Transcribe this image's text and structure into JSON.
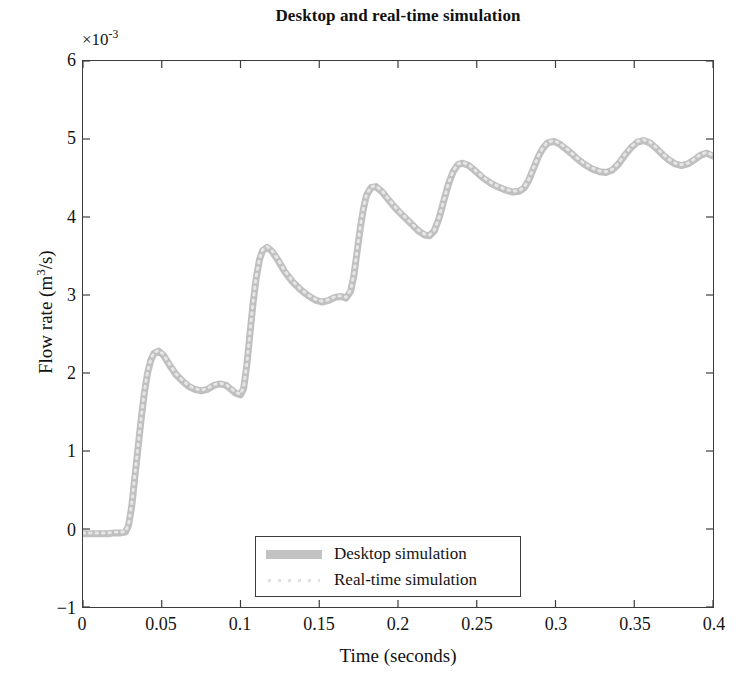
{
  "chart_data": {
    "type": "line",
    "title": "Desktop and real-time simulation",
    "xlabel": "Time (seconds)",
    "ylabel": "Flow rate (m³/s)",
    "y_multiplier": "×10⁻³",
    "y_multiplier_base": "×10",
    "y_multiplier_exp": "-3",
    "xlim": [
      0,
      0.4
    ],
    "ylim": [
      -1,
      6
    ],
    "grid": false,
    "legend_position": "lower center",
    "xticks": [
      0,
      0.05,
      0.1,
      0.15,
      0.2,
      0.25,
      0.3,
      0.35,
      0.4
    ],
    "xtick_labels": [
      "0",
      "0.05",
      "0.1",
      "0.15",
      "0.2",
      "0.25",
      "0.3",
      "0.35",
      "0.4"
    ],
    "yticks": [
      -1,
      0,
      1,
      2,
      3,
      4,
      5,
      6
    ],
    "ytick_labels": [
      "−1",
      "0",
      "1",
      "2",
      "3",
      "4",
      "5",
      "6"
    ],
    "series": [
      {
        "name": "Desktop simulation",
        "color": "#c0c0c0",
        "style": "solid",
        "width": 7,
        "x": [
          0,
          0.004,
          0.008,
          0.012,
          0.016,
          0.02,
          0.024,
          0.027,
          0.029,
          0.031,
          0.033,
          0.035,
          0.037,
          0.039,
          0.041,
          0.043,
          0.045,
          0.048,
          0.051,
          0.055,
          0.059,
          0.063,
          0.067,
          0.071,
          0.075,
          0.079,
          0.083,
          0.087,
          0.091,
          0.094,
          0.097,
          0.1,
          0.102,
          0.104,
          0.106,
          0.108,
          0.11,
          0.112,
          0.114,
          0.117,
          0.12,
          0.124,
          0.128,
          0.133,
          0.138,
          0.143,
          0.148,
          0.152,
          0.156,
          0.16,
          0.164,
          0.167,
          0.17,
          0.172,
          0.174,
          0.176,
          0.178,
          0.18,
          0.183,
          0.186,
          0.19,
          0.194,
          0.199,
          0.204,
          0.209,
          0.213,
          0.217,
          0.22,
          0.223,
          0.226,
          0.229,
          0.232,
          0.235,
          0.238,
          0.241,
          0.245,
          0.249,
          0.254,
          0.259,
          0.264,
          0.269,
          0.273,
          0.277,
          0.28,
          0.283,
          0.286,
          0.289,
          0.292,
          0.295,
          0.299,
          0.303,
          0.308,
          0.313,
          0.318,
          0.323,
          0.328,
          0.332,
          0.336,
          0.34,
          0.344,
          0.348,
          0.352,
          0.356,
          0.36,
          0.364,
          0.368,
          0.372,
          0.376,
          0.38,
          0.384,
          0.388,
          0.392,
          0.396,
          0.4
        ],
        "y": [
          -0.06,
          -0.06,
          -0.06,
          -0.06,
          -0.06,
          -0.05,
          -0.05,
          -0.04,
          0.05,
          0.3,
          0.68,
          1.05,
          1.42,
          1.75,
          2.0,
          2.16,
          2.25,
          2.28,
          2.23,
          2.1,
          1.98,
          1.9,
          1.83,
          1.79,
          1.77,
          1.79,
          1.84,
          1.86,
          1.84,
          1.79,
          1.74,
          1.72,
          1.8,
          2.1,
          2.5,
          2.9,
          3.22,
          3.45,
          3.57,
          3.61,
          3.56,
          3.44,
          3.3,
          3.17,
          3.07,
          2.99,
          2.93,
          2.91,
          2.93,
          2.97,
          2.98,
          2.96,
          3.05,
          3.25,
          3.55,
          3.85,
          4.1,
          4.28,
          4.38,
          4.39,
          4.32,
          4.22,
          4.1,
          4.0,
          3.9,
          3.82,
          3.77,
          3.76,
          3.82,
          3.98,
          4.2,
          4.42,
          4.58,
          4.67,
          4.69,
          4.66,
          4.59,
          4.5,
          4.43,
          4.38,
          4.34,
          4.32,
          4.33,
          4.37,
          4.47,
          4.62,
          4.77,
          4.88,
          4.95,
          4.97,
          4.93,
          4.85,
          4.76,
          4.68,
          4.62,
          4.58,
          4.57,
          4.6,
          4.68,
          4.79,
          4.89,
          4.96,
          4.98,
          4.95,
          4.88,
          4.8,
          4.73,
          4.68,
          4.66,
          4.68,
          4.73,
          4.79,
          4.82,
          4.78
        ]
      },
      {
        "name": "Real-time simulation",
        "color": "#e6e6e6",
        "style": "dotted",
        "width": 3,
        "x": [
          0,
          0.004,
          0.008,
          0.012,
          0.016,
          0.02,
          0.024,
          0.027,
          0.029,
          0.031,
          0.033,
          0.035,
          0.037,
          0.039,
          0.041,
          0.043,
          0.045,
          0.048,
          0.051,
          0.055,
          0.059,
          0.063,
          0.067,
          0.071,
          0.075,
          0.079,
          0.083,
          0.087,
          0.091,
          0.094,
          0.097,
          0.1,
          0.102,
          0.104,
          0.106,
          0.108,
          0.11,
          0.112,
          0.114,
          0.117,
          0.12,
          0.124,
          0.128,
          0.133,
          0.138,
          0.143,
          0.148,
          0.152,
          0.156,
          0.16,
          0.164,
          0.167,
          0.17,
          0.172,
          0.174,
          0.176,
          0.178,
          0.18,
          0.183,
          0.186,
          0.19,
          0.194,
          0.199,
          0.204,
          0.209,
          0.213,
          0.217,
          0.22,
          0.223,
          0.226,
          0.229,
          0.232,
          0.235,
          0.238,
          0.241,
          0.245,
          0.249,
          0.254,
          0.259,
          0.264,
          0.269,
          0.273,
          0.277,
          0.28,
          0.283,
          0.286,
          0.289,
          0.292,
          0.295,
          0.299,
          0.303,
          0.308,
          0.313,
          0.318,
          0.323,
          0.328,
          0.332,
          0.336,
          0.34,
          0.344,
          0.348,
          0.352,
          0.356,
          0.36,
          0.364,
          0.368,
          0.372,
          0.376,
          0.38,
          0.384,
          0.388,
          0.392,
          0.396,
          0.4
        ],
        "y": [
          -0.05,
          -0.05,
          -0.05,
          -0.05,
          -0.05,
          -0.04,
          -0.04,
          -0.03,
          0.07,
          0.33,
          0.71,
          1.08,
          1.44,
          1.77,
          2.02,
          2.17,
          2.26,
          2.29,
          2.24,
          2.11,
          1.99,
          1.91,
          1.84,
          1.8,
          1.78,
          1.8,
          1.85,
          1.87,
          1.85,
          1.8,
          1.75,
          1.73,
          1.82,
          2.12,
          2.52,
          2.92,
          3.24,
          3.46,
          3.58,
          3.62,
          3.57,
          3.45,
          3.31,
          3.18,
          3.08,
          3.0,
          2.94,
          2.92,
          2.94,
          2.98,
          2.99,
          2.97,
          3.07,
          3.27,
          3.57,
          3.87,
          4.11,
          4.29,
          4.39,
          4.4,
          4.33,
          4.23,
          4.11,
          4.01,
          3.91,
          3.83,
          3.78,
          3.77,
          3.83,
          3.99,
          4.21,
          4.43,
          4.59,
          4.68,
          4.7,
          4.67,
          4.6,
          4.51,
          4.44,
          4.39,
          4.35,
          4.33,
          4.34,
          4.38,
          4.48,
          4.63,
          4.78,
          4.89,
          4.96,
          4.98,
          4.94,
          4.86,
          4.77,
          4.69,
          4.63,
          4.59,
          4.58,
          4.61,
          4.69,
          4.8,
          4.9,
          4.97,
          4.99,
          4.96,
          4.89,
          4.81,
          4.74,
          4.69,
          4.67,
          4.69,
          4.74,
          4.8,
          4.83,
          4.79
        ]
      }
    ],
    "legend": [
      "Desktop simulation",
      "Real-time simulation"
    ],
    "axis_color": "#3c3c3c",
    "background": "#ffffff"
  }
}
